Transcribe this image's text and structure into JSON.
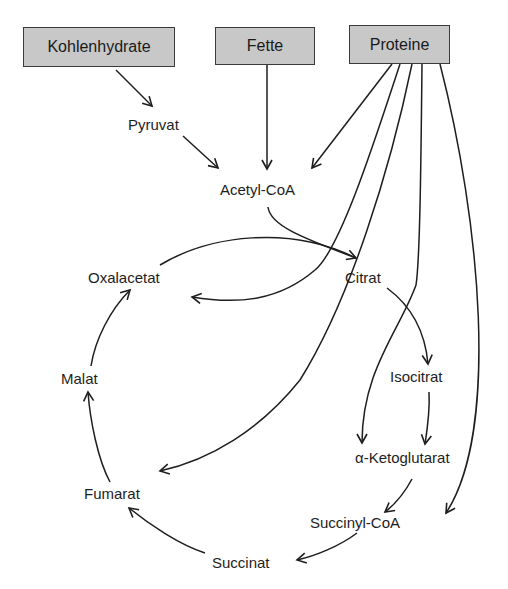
{
  "diagram": {
    "type": "metabolic-pathway",
    "sources": [
      {
        "id": "kohlenhydrate",
        "label": "Kohlenhydrate"
      },
      {
        "id": "fette",
        "label": "Fette"
      },
      {
        "id": "proteine",
        "label": "Proteine"
      }
    ],
    "nodes": {
      "pyruvat": "Pyruvat",
      "acetyl_coa": "Acetyl-CoA",
      "oxalacetat": "Oxalacetat",
      "citrat": "Citrat",
      "isocitrat": "Isocitrat",
      "alpha_ketoglutarat": "α-Ketoglutarat",
      "succinyl_coa": "Succinyl-CoA",
      "succinat": "Succinat",
      "fumarat": "Fumarat",
      "malat": "Malat"
    },
    "edges": [
      [
        "Kohlenhydrate",
        "Pyruvat"
      ],
      [
        "Pyruvat",
        "Acetyl-CoA"
      ],
      [
        "Fette",
        "Acetyl-CoA"
      ],
      [
        "Proteine",
        "Acetyl-CoA"
      ],
      [
        "Proteine",
        "Oxalacetat"
      ],
      [
        "Proteine",
        "Fumarat"
      ],
      [
        "Proteine",
        "α-Ketoglutarat"
      ],
      [
        "Proteine",
        "Succinyl-CoA"
      ],
      [
        "Acetyl-CoA",
        "Citrat"
      ],
      [
        "Oxalacetat",
        "Citrat"
      ],
      [
        "Citrat",
        "Isocitrat"
      ],
      [
        "Isocitrat",
        "α-Ketoglutarat"
      ],
      [
        "α-Ketoglutarat",
        "Succinyl-CoA"
      ],
      [
        "Succinyl-CoA",
        "Succinat"
      ],
      [
        "Succinat",
        "Fumarat"
      ],
      [
        "Fumarat",
        "Malat"
      ],
      [
        "Malat",
        "Oxalacetat"
      ]
    ],
    "colors": {
      "box_fill": "#c8c8c8",
      "box_border": "#3a3a3a",
      "line": "#1e1e1e"
    }
  }
}
